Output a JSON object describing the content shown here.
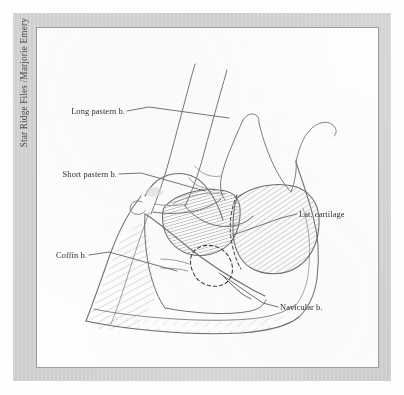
{
  "meta": {
    "credit": "Star Ridge Files /Marjorie Emery",
    "figure_title": "Anatomical line drawing of equine hoof, sagittal / lateral view",
    "media": "pencil line drawing with graphite hatching",
    "frame_color": "#d2d2d2",
    "plate_color": "#fdfdfc",
    "ink_color": "#6a6a6a",
    "label_color": "#2d2d2d"
  },
  "labels": [
    {
      "id": "long-pastern",
      "text": "Long pastern b.",
      "text_x": 88,
      "text_y": 86,
      "anchor": "end",
      "leader": "M 90,83 L 112,79 L 192,90"
    },
    {
      "id": "short-pastern",
      "text": "Short pastern b.",
      "text_x": 80,
      "text_y": 149,
      "anchor": "end",
      "leader": "M 82,146 L 104,145 L 168,163"
    },
    {
      "id": "coffin",
      "text": "Coffin b.",
      "text_x": 50,
      "text_y": 230,
      "anchor": "end",
      "leader": "M 52,227 L 72,224 L 140,243"
    },
    {
      "id": "lat-cartilage",
      "text": "Lat. cartilage",
      "text_x": 262,
      "text_y": 189,
      "anchor": "start",
      "leader": "M 260,186 L 244,190 L 196,207"
    },
    {
      "id": "navicular",
      "text": "Navicular b.",
      "text_x": 243,
      "text_y": 282,
      "anchor": "start",
      "leader": "M 241,279 L 226,275 L 182,245"
    }
  ],
  "structures": [
    {
      "id": "long-pastern-bone",
      "name": "Long pastern bone (proximal phalanx)"
    },
    {
      "id": "short-pastern-bone",
      "name": "Short pastern bone (middle phalanx)"
    },
    {
      "id": "coffin-bone",
      "name": "Coffin bone (distal phalanx)"
    },
    {
      "id": "navicular-bone",
      "name": "Navicular bone (distal sesamoid)"
    },
    {
      "id": "lateral-cartilage",
      "name": "Lateral cartilage"
    },
    {
      "id": "hoof-wall",
      "name": "Hoof wall / sole outline"
    }
  ]
}
